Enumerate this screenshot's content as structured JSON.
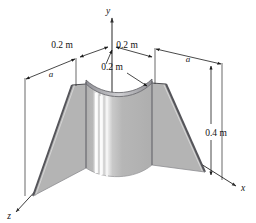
{
  "figure": {
    "colors": {
      "background": "#ffffff",
      "panel_fill": "#b4b4b4",
      "shell_fill": "#b6b6b6",
      "shell_highlight": "#fbfbfb",
      "shell_highlight_soft": "#e2e2e2",
      "edge_dark": "#55555a",
      "edge_rim": "#6a6a70",
      "line": "#222222",
      "axis": "#3a3a3a",
      "text": "#121212"
    },
    "axes": [
      {
        "name": "y-axis",
        "label": "y",
        "label_x": 108,
        "label_y": 14,
        "direction": "up"
      },
      {
        "name": "x-axis",
        "label": "x",
        "label_x": 239,
        "label_y": 190,
        "direction": "down-right"
      },
      {
        "name": "z-axis",
        "label": "z",
        "label_x": 9,
        "label_y": 218,
        "direction": "down-left"
      }
    ],
    "dimensions": [
      {
        "name": "top-left-thickness",
        "label": "0.2 m",
        "x": 62,
        "y": 48
      },
      {
        "name": "top-right-thickness",
        "label": "0.2 m",
        "x": 127,
        "y": 48
      },
      {
        "name": "center-radius",
        "label": "0.2 m",
        "x": 112,
        "y": 70
      },
      {
        "name": "left-panel-width",
        "label": "a",
        "x": 51,
        "y": 77
      },
      {
        "name": "right-panel-width",
        "label": "a",
        "x": 188,
        "y": 62
      },
      {
        "name": "height",
        "label": "0.4 m",
        "x": 216,
        "y": 133
      }
    ]
  }
}
